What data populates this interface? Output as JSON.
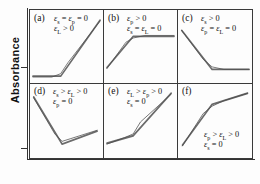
{
  "figure": {
    "y_axis_label": "Absorbance",
    "x_axis_label": "",
    "y_ticks": [
      {
        "name": "baseline-tick-row1",
        "top_px": 58
      },
      {
        "name": "baseline-tick-row2",
        "top_px": 139
      }
    ],
    "line_colors": {
      "thick_trace": "#6b6b6b",
      "thin_trace": "#4a4a4a",
      "axis": "#3a3a3a"
    }
  },
  "chart_data": {
    "type": "line",
    "title": "",
    "xlabel": "",
    "ylabel": "Absorbance",
    "grid": false,
    "legend": "none",
    "panels": [
      {
        "tag": "(a)",
        "conditions": [
          "εs = εp = 0",
          "εL > 0"
        ],
        "cond_html": [
          "<span class=\"eps\">ε</span><sub>s</sub> = <span class=\"eps\">ε</span><sub>p</sub> = 0",
          "<span class=\"eps\">ε</span><sub>L</sub> > 0"
        ],
        "shape": "flat-then-rise",
        "thick_points": [
          [
            4,
            78
          ],
          [
            42,
            78
          ],
          [
            96,
            12
          ]
        ],
        "thin_points": [
          [
            4,
            79
          ],
          [
            30,
            79
          ],
          [
            42,
            75
          ],
          [
            52,
            62
          ],
          [
            96,
            13
          ]
        ],
        "x": [
          0,
          0.42,
          1.0
        ],
        "y": [
          0.06,
          0.06,
          0.86
        ]
      },
      {
        "tag": "(b)",
        "conditions": [
          "εp > 0",
          "εs = εL = 0"
        ],
        "cond_html": [
          "<span class=\"eps\">ε</span><sub>p</sub> > 0",
          "<span class=\"eps\">ε</span><sub>s</sub> = <span class=\"eps\">ε</span><sub>L</sub> = 0"
        ],
        "shape": "rise-then-flat",
        "thick_points": [
          [
            4,
            68
          ],
          [
            40,
            31
          ],
          [
            96,
            31
          ]
        ],
        "thin_points": [
          [
            4,
            69
          ],
          [
            30,
            38
          ],
          [
            40,
            33
          ],
          [
            56,
            30
          ],
          [
            96,
            30
          ]
        ],
        "x": [
          0,
          0.48,
          1.0
        ],
        "y": [
          0.18,
          0.63,
          0.63
        ]
      },
      {
        "tag": "(c)",
        "conditions": [
          "εs > 0",
          "εp = εL = 0"
        ],
        "cond_html": [
          "<span class=\"eps\">ε</span><sub>s</sub> > 0",
          "<span class=\"eps\">ε</span><sub>p</sub> = <span class=\"eps\">ε</span><sub>L</sub> = 0"
        ],
        "shape": "fall-then-flat",
        "thick_points": [
          [
            5,
            24
          ],
          [
            46,
            70
          ],
          [
            96,
            70
          ]
        ],
        "thin_points": [
          [
            5,
            24
          ],
          [
            34,
            58
          ],
          [
            46,
            67
          ],
          [
            62,
            70
          ],
          [
            96,
            70
          ]
        ],
        "x": [
          0,
          0.46,
          1.0
        ],
        "y": [
          0.74,
          0.16,
          0.16
        ]
      },
      {
        "tag": "(d)",
        "conditions": [
          "εs > εL > 0",
          "εp = 0"
        ],
        "cond_html": [
          "<span class=\"eps\">ε</span><sub>s</sub> > <span class=\"eps\">ε</span><sub>L</sub> > 0",
          "<span class=\"eps\">ε</span><sub>p</sub> = 0"
        ],
        "shape": "v-shape",
        "thick_points": [
          [
            5,
            14
          ],
          [
            44,
            65
          ],
          [
            92,
            51
          ]
        ],
        "thin_points": [
          [
            5,
            15
          ],
          [
            34,
            54
          ],
          [
            44,
            62
          ],
          [
            56,
            59
          ],
          [
            92,
            50
          ]
        ],
        "x": [
          0,
          0.46,
          1.0
        ],
        "y": [
          0.82,
          0.1,
          0.29
        ]
      },
      {
        "tag": "(e)",
        "conditions": [
          "εL > εp > 0",
          "εs = 0"
        ],
        "cond_html": [
          "<span class=\"eps\">ε</span><sub>L</sub> > <span class=\"eps\">ε</span><sub>p</sub> > 0",
          "<span class=\"eps\">ε</span><sub>s</sub> = 0"
        ],
        "shape": "shallow-then-steep-rise",
        "thick_points": [
          [
            4,
            64
          ],
          [
            40,
            56
          ],
          [
            92,
            10
          ]
        ],
        "thin_points": [
          [
            4,
            65
          ],
          [
            28,
            58
          ],
          [
            40,
            54
          ],
          [
            50,
            41
          ],
          [
            92,
            11
          ]
        ],
        "x": [
          0,
          0.45,
          1.0
        ],
        "y": [
          0.18,
          0.28,
          0.88
        ]
      },
      {
        "tag": "(f)",
        "conditions": [
          "εp > εL > 0",
          "εs = 0"
        ],
        "cond_html": [
          "<span class=\"eps\">ε</span><sub>p</sub> > <span class=\"eps\">ε</span><sub>L</sub> > 0",
          "<span class=\"eps\">ε</span><sub>s</sub> = 0"
        ],
        "shape": "steep-then-shallow-rise",
        "thick_points": [
          [
            6,
            66
          ],
          [
            46,
            22
          ],
          [
            94,
            10
          ]
        ],
        "thin_points": [
          [
            6,
            67
          ],
          [
            34,
            32
          ],
          [
            46,
            24
          ],
          [
            62,
            18
          ],
          [
            94,
            10
          ]
        ],
        "x": [
          0,
          0.46,
          1.0
        ],
        "y": [
          0.15,
          0.72,
          0.88
        ]
      }
    ]
  }
}
